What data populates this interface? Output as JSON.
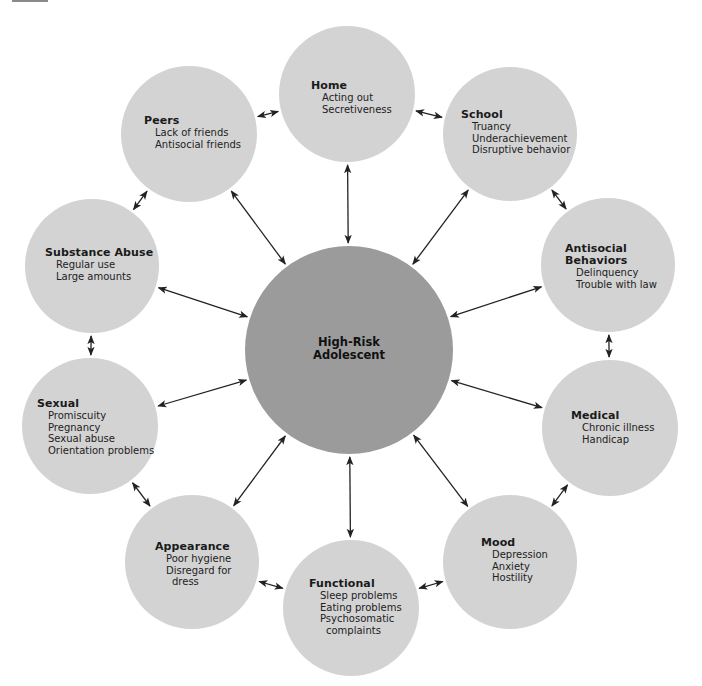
{
  "diagram": {
    "type": "hub-and-spoke",
    "colors": {
      "center_fill": "#9b9b9b",
      "node_fill": "#d3d3d3",
      "arrow": "#222222",
      "text": "#1a1a1a"
    },
    "center": {
      "title_line1": "High-Risk",
      "title_line2": "Adolescent",
      "cx": 349,
      "cy": 350,
      "r": 104
    },
    "nodes": [
      {
        "id": "home",
        "title": "Home",
        "items": [
          "Acting out",
          "Secretiveness"
        ],
        "cx": 347,
        "cy": 94,
        "r": 68,
        "tx": 311,
        "ty": 80
      },
      {
        "id": "school",
        "title": "School",
        "items": [
          "Truancy",
          "Underachievement",
          "Disruptive behavior"
        ],
        "cx": 510,
        "cy": 134,
        "r": 67,
        "tx": 461,
        "ty": 109
      },
      {
        "id": "antisocial",
        "title": "Antisocial Behaviors",
        "title_lines": [
          "Antisocial",
          "Behaviors"
        ],
        "items": [
          "Delinquency",
          "Trouble with law"
        ],
        "cx": 608,
        "cy": 265,
        "r": 67,
        "tx": 565,
        "ty": 243
      },
      {
        "id": "medical",
        "title": "Medical",
        "items": [
          "Chronic illness",
          "Handicap"
        ],
        "cx": 610,
        "cy": 428,
        "r": 68,
        "tx": 571,
        "ty": 410
      },
      {
        "id": "mood",
        "title": "Mood",
        "items": [
          "Depression",
          "Anxiety",
          "Hostility"
        ],
        "cx": 510,
        "cy": 562,
        "r": 67,
        "tx": 481,
        "ty": 537
      },
      {
        "id": "functional",
        "title": "Functional",
        "items": [
          "Sleep problems",
          "Eating problems",
          "Psychosomatic",
          "  complaints"
        ],
        "cx": 351,
        "cy": 608,
        "r": 68,
        "tx": 309,
        "ty": 578
      },
      {
        "id": "appearance",
        "title": "Appearance",
        "items": [
          "Poor hygiene",
          "Disregard for",
          "  dress"
        ],
        "cx": 192,
        "cy": 562,
        "r": 67,
        "tx": 155,
        "ty": 541
      },
      {
        "id": "sexual",
        "title": "Sexual",
        "items": [
          "Promiscuity",
          "Pregnancy",
          "Sexual abuse",
          "Orientation problems"
        ],
        "cx": 90,
        "cy": 426,
        "r": 68,
        "tx": 37,
        "ty": 398
      },
      {
        "id": "substance",
        "title": "Substance Abuse",
        "items": [
          "Regular use",
          "Large amounts"
        ],
        "cx": 92,
        "cy": 266,
        "r": 67,
        "tx": 45,
        "ty": 247
      },
      {
        "id": "peers",
        "title": "Peers",
        "items": [
          "Lack of friends",
          "Antisocial friends"
        ],
        "cx": 189,
        "cy": 134,
        "r": 68,
        "tx": 144,
        "ty": 115
      }
    ],
    "arrows": [
      {
        "from": "center",
        "to": "home"
      },
      {
        "from": "center",
        "to": "school"
      },
      {
        "from": "center",
        "to": "antisocial"
      },
      {
        "from": "center",
        "to": "medical"
      },
      {
        "from": "center",
        "to": "mood"
      },
      {
        "from": "center",
        "to": "functional"
      },
      {
        "from": "center",
        "to": "appearance"
      },
      {
        "from": "center",
        "to": "sexual"
      },
      {
        "from": "center",
        "to": "substance"
      },
      {
        "from": "center",
        "to": "peers"
      },
      {
        "from": "home",
        "to": "school"
      },
      {
        "from": "school",
        "to": "antisocial"
      },
      {
        "from": "antisocial",
        "to": "medical"
      },
      {
        "from": "medical",
        "to": "mood"
      },
      {
        "from": "mood",
        "to": "functional"
      },
      {
        "from": "functional",
        "to": "appearance"
      },
      {
        "from": "appearance",
        "to": "sexual"
      },
      {
        "from": "sexual",
        "to": "substance"
      },
      {
        "from": "substance",
        "to": "peers"
      },
      {
        "from": "peers",
        "to": "home"
      }
    ]
  }
}
